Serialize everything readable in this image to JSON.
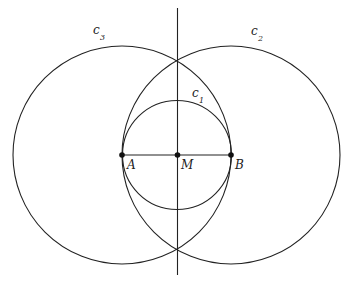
{
  "diagram": {
    "stroke_color": "#222222",
    "background": "#ffffff",
    "points": [
      {
        "name": "A",
        "label": "A",
        "x": 122,
        "y": 155
      },
      {
        "name": "M",
        "label": "M",
        "x": 177,
        "y": 155
      },
      {
        "name": "B",
        "label": "B",
        "x": 231,
        "y": 155
      }
    ],
    "circles": [
      {
        "name": "c1",
        "label": "c",
        "sub": "1",
        "cx": 177,
        "cy": 155,
        "r": 54.5,
        "label_x": 164,
        "label_y": 94
      },
      {
        "name": "c2",
        "label": "c",
        "sub": "2",
        "cx": 231,
        "cy": 155,
        "r": 109,
        "label_x": 250,
        "label_y": 38
      },
      {
        "name": "c3",
        "label": "c",
        "sub": "3",
        "cx": 122,
        "cy": 155,
        "r": 109,
        "label_x": 93,
        "label_y": 37
      }
    ],
    "segment": {
      "name": "AB",
      "from": "A",
      "to": "B"
    },
    "bisector_line": {
      "x": 177.5,
      "y1": 8,
      "y2": 275
    },
    "point_labels": {
      "A": "A",
      "M": "M",
      "B": "B"
    },
    "circle_labels": {
      "c1": "c",
      "c1_sub": "1",
      "c2": "c",
      "c2_sub": "2",
      "c3": "c",
      "c3_sub": "3"
    }
  }
}
